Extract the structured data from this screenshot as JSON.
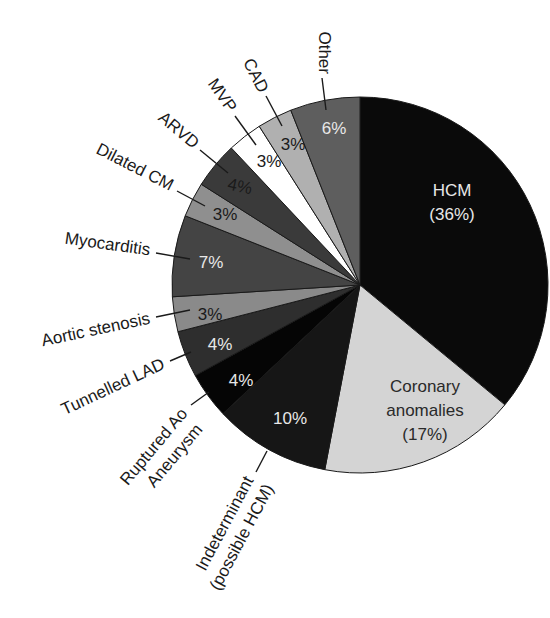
{
  "chart_data": {
    "type": "pie",
    "title": "",
    "start_angle_deg": 0,
    "direction": "clockwise",
    "slices": [
      {
        "label": "HCM",
        "value": 36,
        "display": "(36%)",
        "color": "#0a0a0a",
        "text_color": "#e8e8e8"
      },
      {
        "label": "Coronary anomalies",
        "value": 17,
        "display": "(17%)",
        "color": "#d4d4d4",
        "text_color": "#2a2a2a"
      },
      {
        "label": "Indeterminant (possible HCM)",
        "value": 10,
        "display": "10%",
        "color": "#161616",
        "text_color": "#e8e8e8"
      },
      {
        "label": "Ruptured Ao Aneurysm",
        "value": 4,
        "display": "4%",
        "color": "#050505",
        "text_color": "#e8e8e8"
      },
      {
        "label": "Tunnelled LAD",
        "value": 4,
        "display": "4%",
        "color": "#2e2e2e",
        "text_color": "#e8e8e8"
      },
      {
        "label": "Aortic stenosis",
        "value": 3,
        "display": "3%",
        "color": "#8a8a8a",
        "text_color": "#1a1a1a"
      },
      {
        "label": "Myocarditis",
        "value": 7,
        "display": "7%",
        "color": "#444444",
        "text_color": "#e8e8e8"
      },
      {
        "label": "Dilated CM",
        "value": 3,
        "display": "3%",
        "color": "#8f8f8f",
        "text_color": "#1a1a1a"
      },
      {
        "label": "ARVD",
        "value": 4,
        "display": "4%",
        "color": "#3a3a3a",
        "text_color": "#1a1a1a"
      },
      {
        "label": "MVP",
        "value": 3,
        "display": "3%",
        "color": "#ffffff",
        "text_color": "#1a1a1a"
      },
      {
        "label": "CAD",
        "value": 3,
        "display": "3%",
        "color": "#b0b0b0",
        "text_color": "#1a1a1a"
      },
      {
        "label": "Other",
        "value": 6,
        "display": "6%",
        "color": "#5e5e5e",
        "text_color": "#e8e8e8"
      }
    ],
    "legend": "none (callout labels)"
  },
  "labels": {
    "hcm_name": "HCM",
    "hcm_pct": "(36%)",
    "coronary_line1": "Coronary",
    "coronary_line2": "anomalies",
    "coronary_pct": "(17%)",
    "indeterminant_pct": "10%",
    "indeterminant_line1": "Indeterminant",
    "indeterminant_line2": "(possible HCM)",
    "ruptured_pct": "4%",
    "ruptured_line1": "Ruptured Ao",
    "ruptured_line2": "Aneurysm",
    "tunnelled_pct": "4%",
    "tunnelled_name": "Tunnelled LAD",
    "aortic_pct": "3%",
    "aortic_name": "Aortic stenosis",
    "myocarditis_pct": "7%",
    "myocarditis_name": "Myocarditis",
    "dilated_pct": "3%",
    "dilated_name": "Dilated CM",
    "arvd_pct": "4%",
    "arvd_name": "ARVD",
    "mvp_pct": "3%",
    "mvp_name": "MVP",
    "cad_pct": "3%",
    "cad_name": "CAD",
    "other_pct": "6%",
    "other_name": "Other"
  }
}
